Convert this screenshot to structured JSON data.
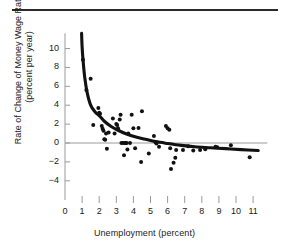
{
  "chart_data": {
    "type": "scatter",
    "title": "",
    "xlabel": "Unemployment (percent)",
    "ylabel_line1": "Rate of Change of Money Wage Rates",
    "ylabel_line2": "(percent per year)",
    "xlim": [
      0,
      11.6
    ],
    "ylim": [
      -5.2,
      11.6
    ],
    "xticks": [
      0,
      1,
      2,
      3,
      4,
      5,
      6,
      7,
      8,
      9,
      10,
      11
    ],
    "xtick_labels": [
      "0",
      "1",
      "2",
      "3",
      "4",
      "5",
      "6",
      "7",
      "8",
      "9",
      "10",
      "11"
    ],
    "yticks": [
      10,
      8,
      6,
      4,
      2,
      0,
      -2,
      -4
    ],
    "ytick_labels": [
      "10",
      "8",
      "6",
      "4",
      "2",
      "0",
      "−2",
      "−4"
    ],
    "grid": false,
    "zero_line": true,
    "legend": "none",
    "marker_color": "#111111",
    "curve_color": "#111111",
    "axis_color": "#9a9a9a",
    "points": [
      [
        1.05,
        8.8
      ],
      [
        1.25,
        5.6
      ],
      [
        1.5,
        6.8
      ],
      [
        1.65,
        1.9
      ],
      [
        1.95,
        3.7
      ],
      [
        2.0,
        3.2
      ],
      [
        2.05,
        3.1
      ],
      [
        2.15,
        1.8
      ],
      [
        2.2,
        1.5
      ],
      [
        2.25,
        1.3
      ],
      [
        2.3,
        0.4
      ],
      [
        2.35,
        0.35
      ],
      [
        2.4,
        1.0
      ],
      [
        2.45,
        -0.6
      ],
      [
        2.55,
        1.1
      ],
      [
        2.8,
        2.6
      ],
      [
        2.9,
        1.0
      ],
      [
        3.0,
        2.0
      ],
      [
        3.05,
        1.9
      ],
      [
        3.1,
        1.55
      ],
      [
        3.2,
        2.5
      ],
      [
        3.25,
        3.0
      ],
      [
        3.3,
        0.0
      ],
      [
        3.4,
        0.0
      ],
      [
        3.45,
        -1.3
      ],
      [
        3.5,
        0.0
      ],
      [
        3.55,
        0.0
      ],
      [
        3.6,
        0.0
      ],
      [
        3.65,
        -0.7
      ],
      [
        3.7,
        1.0
      ],
      [
        3.8,
        0.0
      ],
      [
        3.9,
        3.0
      ],
      [
        4.0,
        1.55
      ],
      [
        4.1,
        -0.55
      ],
      [
        4.3,
        1.6
      ],
      [
        4.45,
        -2.0
      ],
      [
        4.5,
        3.35
      ],
      [
        4.9,
        -1.1
      ],
      [
        5.2,
        0.75
      ],
      [
        5.3,
        0.05
      ],
      [
        5.35,
        -0.05
      ],
      [
        5.5,
        -0.4
      ],
      [
        5.9,
        1.8
      ],
      [
        6.0,
        1.55
      ],
      [
        6.1,
        1.4
      ],
      [
        6.15,
        -0.55
      ],
      [
        6.2,
        -2.75
      ],
      [
        6.35,
        -2.1
      ],
      [
        6.45,
        -1.55
      ],
      [
        6.5,
        -0.75
      ],
      [
        6.9,
        -0.75
      ],
      [
        7.2,
        -0.35
      ],
      [
        7.5,
        -0.8
      ],
      [
        7.9,
        -0.75
      ],
      [
        8.2,
        -0.65
      ],
      [
        8.8,
        -0.4
      ],
      [
        8.9,
        -0.45
      ],
      [
        9.7,
        -0.25
      ],
      [
        10.8,
        -1.5
      ]
    ],
    "curve": [
      [
        0.97,
        11.6
      ],
      [
        1.0,
        10.2
      ],
      [
        1.05,
        8.9
      ],
      [
        1.15,
        7.0
      ],
      [
        1.3,
        5.3
      ],
      [
        1.5,
        4.0
      ],
      [
        1.75,
        3.3
      ],
      [
        2.0,
        2.9
      ],
      [
        2.3,
        2.3
      ],
      [
        2.7,
        1.75
      ],
      [
        3.1,
        1.35
      ],
      [
        3.6,
        0.95
      ],
      [
        4.1,
        0.65
      ],
      [
        4.7,
        0.4
      ],
      [
        5.3,
        0.15
      ],
      [
        6.0,
        -0.05
      ],
      [
        6.8,
        -0.25
      ],
      [
        7.6,
        -0.4
      ],
      [
        8.5,
        -0.5
      ],
      [
        9.4,
        -0.6
      ],
      [
        10.3,
        -0.7
      ],
      [
        11.3,
        -0.8
      ]
    ]
  }
}
